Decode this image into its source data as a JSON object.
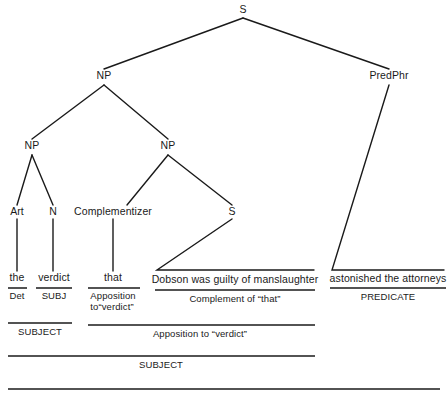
{
  "diagram": {
    "type": "syntax-tree",
    "sentence": "the verdict that Dobson was guilty of manslaughter astonished the attorneys",
    "line_color": "#1a1a1a",
    "background_color": "#ffffff",
    "nodes": {
      "root_s": "S",
      "subject_np": "NP",
      "pred_phr": "PredPhr",
      "inner_np_left": "NP",
      "inner_np_right": "NP",
      "art": "Art",
      "n": "N",
      "complementizer": "Complementizer",
      "embedded_s": "S"
    },
    "terminals": {
      "the": "the",
      "verdict": "verdict",
      "that": "that",
      "dobson_clause": "Dobson was guilty of manslaughter",
      "predicate_phrase": "astonished the attorneys"
    },
    "function_row_1": {
      "det": "Det",
      "subj": "SUBJ",
      "apposition_to_verdict_line1": "Apposition",
      "apposition_to_verdict_line2": "to“verdict”",
      "complement_of_that": "Complement of “that”",
      "predicate": "PREDICATE"
    },
    "function_row_2": {
      "subject": "SUBJECT",
      "apposition_to_verdict": "Apposition to “verdict”"
    },
    "function_row_3": {
      "subject": "SUBJECT"
    },
    "function_row_4": {
      "predication": ""
    }
  }
}
